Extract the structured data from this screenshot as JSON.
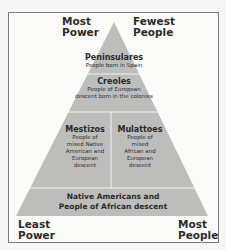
{
  "diagram": {
    "type": "social-pyramid",
    "colors": {
      "pyramid_fill": "#bdbdbb",
      "divider": "#f2f2f0",
      "border": "#7a7a7a",
      "text": "#2a2a2a"
    },
    "corner_labels": {
      "top_left": "Most Power",
      "top_left_line1": "Most",
      "top_left_line2": "Power",
      "top_right_line1": "Fewest",
      "top_right_line2": "People",
      "bottom_left_line1": "Least",
      "bottom_left_line2": "Power",
      "bottom_right_line1": "Most",
      "bottom_right_line2": "People"
    },
    "tiers": [
      {
        "name": "Peninsulares",
        "description": [
          "People born in Spain"
        ]
      },
      {
        "name": "Creoles",
        "description": [
          "People of European",
          "descent born in the colonies"
        ]
      },
      {
        "name": "Mestizos",
        "description": [
          "People of",
          "mixed Native",
          "American and",
          "European",
          "descent"
        ]
      },
      {
        "name": "Mulattoes",
        "description": [
          "People of",
          "mixed",
          "African and",
          "European",
          "descent"
        ]
      },
      {
        "name": "",
        "description": [
          "Native Americans and",
          "People of African descent"
        ]
      }
    ]
  }
}
